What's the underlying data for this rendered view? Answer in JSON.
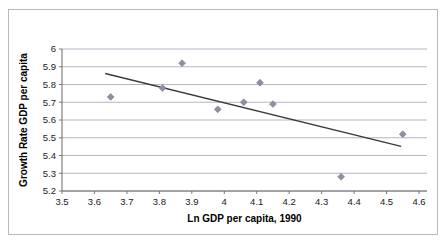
{
  "chart_data": {
    "type": "scatter",
    "title": "",
    "xlabel": "Ln GDP per capita, 1990",
    "ylabel": "Growth Rate GDP per capita",
    "xlim": [
      3.5,
      4.6
    ],
    "ylim": [
      5.2,
      6.0
    ],
    "xticks": [
      "3.5",
      "3.6",
      "3.7",
      "3.8",
      "3.9",
      "4",
      "4.1",
      "4.2",
      "4.3",
      "4.4",
      "4.5",
      "4.6"
    ],
    "xtick_values": [
      3.5,
      3.6,
      3.7,
      3.8,
      3.9,
      4.0,
      4.1,
      4.2,
      4.3,
      4.4,
      4.5,
      4.6
    ],
    "yticks": [
      "5.2",
      "5.3",
      "5.4",
      "5.5",
      "5.6",
      "5.7",
      "5.8",
      "5.9",
      "6"
    ],
    "ytick_values": [
      5.2,
      5.3,
      5.4,
      5.5,
      5.6,
      5.7,
      5.8,
      5.9,
      6.0
    ],
    "grid": "horizontal",
    "legend": "none",
    "x": [
      3.65,
      3.81,
      3.87,
      3.98,
      4.06,
      4.11,
      4.15,
      4.36,
      4.55
    ],
    "y": [
      5.73,
      5.78,
      5.92,
      5.66,
      5.7,
      5.81,
      5.69,
      5.28,
      5.52
    ],
    "points": [
      {
        "x": 3.65,
        "y": 5.73
      },
      {
        "x": 3.81,
        "y": 5.78
      },
      {
        "x": 3.87,
        "y": 5.92
      },
      {
        "x": 3.98,
        "y": 5.66
      },
      {
        "x": 4.06,
        "y": 5.7
      },
      {
        "x": 4.11,
        "y": 5.81
      },
      {
        "x": 4.15,
        "y": 5.69
      },
      {
        "x": 4.36,
        "y": 5.28
      },
      {
        "x": 4.55,
        "y": 5.52
      }
    ],
    "trendline": {
      "x0": 3.633,
      "y0": 5.862,
      "x1": 4.545,
      "y1": 5.452
    },
    "marker_color": "#8f8f9e",
    "trendline_color": "#3a3a3a",
    "gridline_color": "#9aa6b5",
    "axis_color": "#6b6b6b",
    "border_color": "#b9b9b9"
  }
}
